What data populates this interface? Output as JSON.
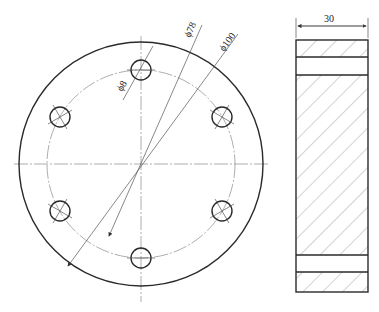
{
  "drawing": {
    "front_view": {
      "center": [
        141,
        164
      ],
      "outer_diameter_label": "ϕ100",
      "bolt_circle_label": "ϕ78",
      "hole_label": "ϕ8",
      "hole_count": 6
    },
    "section_view": {
      "width_label": "30"
    }
  }
}
